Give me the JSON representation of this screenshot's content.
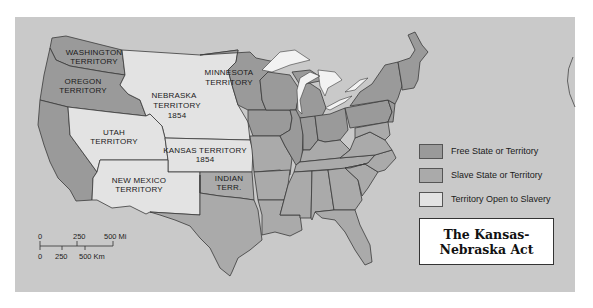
{
  "map": {
    "title_lines": [
      "The Kansas-",
      "Nebraska Act"
    ],
    "colors": {
      "background": "#c9c9c9",
      "free": "#9a9a9a",
      "slave": "#aaaaaa",
      "open": "#e3e3e3",
      "water": "#f2f2f2",
      "border": "#3a3a3a"
    },
    "labels": {
      "washington": [
        "WASHINGTON",
        "TERRITORY"
      ],
      "oregon": [
        "OREGON",
        "TERRITORY"
      ],
      "nebraska": [
        "NEBRASKA",
        "TERRITORY",
        "1854"
      ],
      "minnesota": [
        "MINNESOTA",
        "TERRITORY"
      ],
      "utah": [
        "UTAH",
        "TERRITORY"
      ],
      "kansas": [
        "KANSAS TERRITORY",
        "1854"
      ],
      "new_mexico": [
        "NEW MEXICO",
        "TERRITORY"
      ],
      "indian": [
        "INDIAN",
        "TERR."
      ]
    },
    "legend": [
      {
        "key": "free",
        "label": "Free State or Territory"
      },
      {
        "key": "slave",
        "label": "Slave State or Territory"
      },
      {
        "key": "open",
        "label": "Territory Open to Slavery"
      }
    ],
    "scale": {
      "miles": [
        "0",
        "250",
        "500 Mi"
      ],
      "km": [
        "0",
        "250",
        "500 Km"
      ]
    }
  }
}
